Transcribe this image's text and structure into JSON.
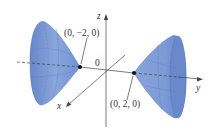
{
  "figure": {
    "axes": {
      "x_label": "x",
      "y_label": "y",
      "z_label": "z",
      "origin_label": "0"
    },
    "points": [
      {
        "label": "(0, −2, 0)"
      },
      {
        "label": "(0, 2, 0)"
      }
    ],
    "colors": {
      "surface": "#7b9ad6",
      "surface_dark": "#5877bd",
      "surface_light": "#a9bfe8",
      "axis": "#444444"
    }
  }
}
